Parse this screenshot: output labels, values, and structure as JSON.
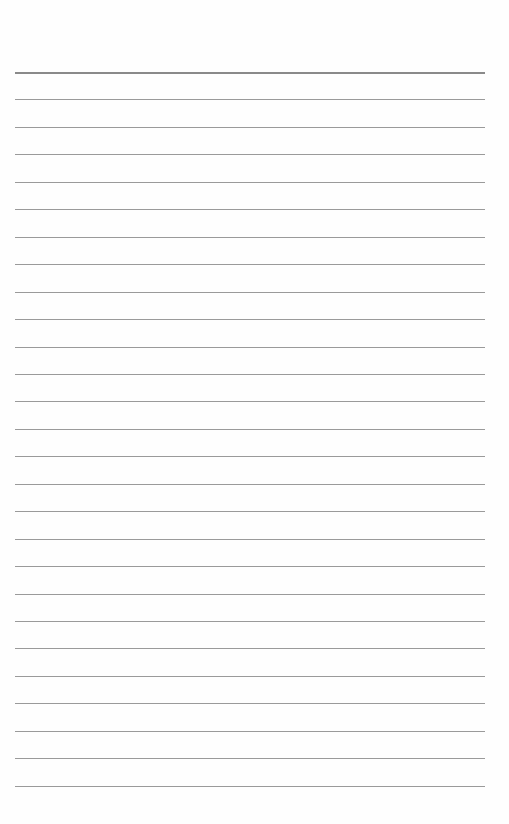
{
  "document": {
    "type": "lined-paper",
    "background_color": "#fefefe",
    "line_color": "#9a9a9a",
    "header_line_color": "#8a8a8a",
    "line_count": 27,
    "first_line_y": 72,
    "line_spacing": 27.45,
    "line_left": 15,
    "line_width": 470
  }
}
